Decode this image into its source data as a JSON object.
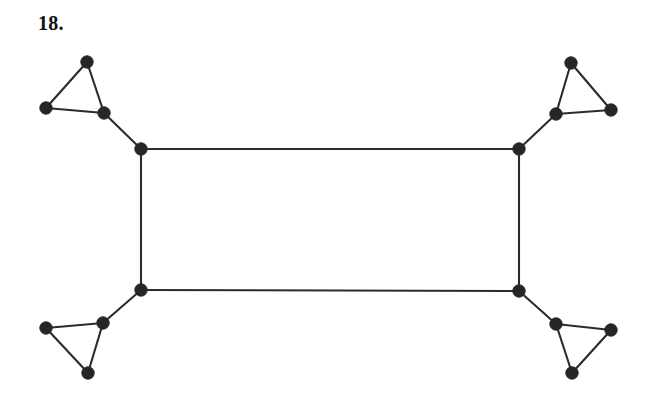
{
  "figure": {
    "problem_label": "18.",
    "background_color": "#ffffff",
    "edge_color": "#2b2b2b",
    "vertex_color": "#262626",
    "vertex_radius": 6.2,
    "edge_width": 2.1,
    "width": 658,
    "height": 407,
    "vertex_count": 16,
    "edge_count": 20
  },
  "graph": {
    "vertices": [
      {
        "id": "tl-apex",
        "label": "top-left-triangle-apex",
        "x": 87,
        "y": 62
      },
      {
        "id": "tl-left",
        "label": "top-left-triangle-left",
        "x": 46,
        "y": 108
      },
      {
        "id": "tl-hub",
        "label": "top-left-triangle-hub",
        "x": 104,
        "y": 113
      },
      {
        "id": "rect-tl",
        "label": "rectangle-top-left-corner",
        "x": 141,
        "y": 149
      },
      {
        "id": "tr-apex",
        "label": "top-right-triangle-apex",
        "x": 571,
        "y": 63
      },
      {
        "id": "tr-right",
        "label": "top-right-triangle-right",
        "x": 611,
        "y": 110
      },
      {
        "id": "tr-hub",
        "label": "top-right-triangle-hub",
        "x": 556,
        "y": 114
      },
      {
        "id": "rect-tr",
        "label": "rectangle-top-right-corner",
        "x": 519,
        "y": 149
      },
      {
        "id": "rect-bl",
        "label": "rectangle-bottom-left-corner",
        "x": 141,
        "y": 290
      },
      {
        "id": "bl-hub",
        "label": "bottom-left-triangle-hub",
        "x": 103,
        "y": 323
      },
      {
        "id": "bl-left",
        "label": "bottom-left-triangle-left",
        "x": 46,
        "y": 328
      },
      {
        "id": "bl-apex",
        "label": "bottom-left-triangle-apex",
        "x": 88,
        "y": 373
      },
      {
        "id": "rect-br",
        "label": "rectangle-bottom-right-corner",
        "x": 519,
        "y": 291
      },
      {
        "id": "br-hub",
        "label": "bottom-right-triangle-hub",
        "x": 556,
        "y": 324
      },
      {
        "id": "br-right",
        "label": "bottom-right-triangle-right",
        "x": 611,
        "y": 330
      },
      {
        "id": "br-apex",
        "label": "bottom-right-triangle-apex",
        "x": 572,
        "y": 373
      }
    ],
    "edges": [
      {
        "from": "rect-tl",
        "to": "rect-tr",
        "label": "rectangle-top-side"
      },
      {
        "from": "rect-tr",
        "to": "rect-br",
        "label": "rectangle-right-side"
      },
      {
        "from": "rect-br",
        "to": "rect-bl",
        "label": "rectangle-bottom-side"
      },
      {
        "from": "rect-bl",
        "to": "rect-tl",
        "label": "rectangle-left-side"
      },
      {
        "from": "rect-tl",
        "to": "tl-hub",
        "label": "top-left-connector"
      },
      {
        "from": "tl-hub",
        "to": "tl-apex",
        "label": "top-left-triangle-edge-a"
      },
      {
        "from": "tl-apex",
        "to": "tl-left",
        "label": "top-left-triangle-edge-b"
      },
      {
        "from": "tl-left",
        "to": "tl-hub",
        "label": "top-left-triangle-edge-c"
      },
      {
        "from": "rect-tr",
        "to": "tr-hub",
        "label": "top-right-connector"
      },
      {
        "from": "tr-hub",
        "to": "tr-apex",
        "label": "top-right-triangle-edge-a"
      },
      {
        "from": "tr-apex",
        "to": "tr-right",
        "label": "top-right-triangle-edge-b"
      },
      {
        "from": "tr-right",
        "to": "tr-hub",
        "label": "top-right-triangle-edge-c"
      },
      {
        "from": "rect-bl",
        "to": "bl-hub",
        "label": "bottom-left-connector"
      },
      {
        "from": "bl-hub",
        "to": "bl-left",
        "label": "bottom-left-triangle-edge-a"
      },
      {
        "from": "bl-left",
        "to": "bl-apex",
        "label": "bottom-left-triangle-edge-b"
      },
      {
        "from": "bl-apex",
        "to": "bl-hub",
        "label": "bottom-left-triangle-edge-c"
      },
      {
        "from": "rect-br",
        "to": "br-hub",
        "label": "bottom-right-connector"
      },
      {
        "from": "br-hub",
        "to": "br-right",
        "label": "bottom-right-triangle-edge-a"
      },
      {
        "from": "br-right",
        "to": "br-apex",
        "label": "bottom-right-triangle-edge-b"
      },
      {
        "from": "br-apex",
        "to": "br-hub",
        "label": "bottom-right-triangle-edge-c"
      }
    ]
  }
}
